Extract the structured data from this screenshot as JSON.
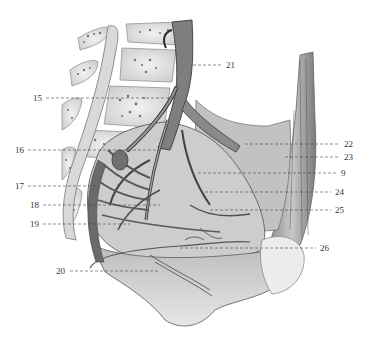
{
  "figure": {
    "colors": {
      "background": "#ffffff",
      "ink": "#2e2e2e",
      "tissue_light": "#d8d8d8",
      "tissue_mid": "#a8a8a8",
      "tissue_dark": "#5a5a5a",
      "leader": "#444444"
    }
  },
  "labels": [
    {
      "id": "21",
      "text": "21",
      "x": 226,
      "y": 61,
      "line": [
        193,
        65,
        222,
        65
      ]
    },
    {
      "id": "15",
      "text": "15",
      "x": 33,
      "y": 94,
      "line": [
        46,
        98,
        176,
        98
      ]
    },
    {
      "id": "16",
      "text": "16",
      "x": 15,
      "y": 146,
      "line": [
        28,
        150,
        162,
        150
      ]
    },
    {
      "id": "17",
      "text": "17",
      "x": 15,
      "y": 182,
      "line": [
        28,
        186,
        96,
        186
      ]
    },
    {
      "id": "18",
      "text": "18",
      "x": 30,
      "y": 201,
      "line": [
        43,
        205,
        160,
        205
      ]
    },
    {
      "id": "19",
      "text": "19",
      "x": 30,
      "y": 220,
      "line": [
        43,
        224,
        130,
        224
      ]
    },
    {
      "id": "20",
      "text": "20",
      "x": 56,
      "y": 267,
      "line": [
        70,
        271,
        160,
        271
      ]
    },
    {
      "id": "22",
      "text": "22",
      "x": 344,
      "y": 140,
      "line": [
        245,
        144,
        340,
        144
      ]
    },
    {
      "id": "23",
      "text": "23",
      "x": 344,
      "y": 153,
      "line": [
        285,
        157,
        340,
        157
      ]
    },
    {
      "id": "9",
      "text": "9",
      "x": 341,
      "y": 169,
      "line": [
        198,
        173,
        337,
        173
      ]
    },
    {
      "id": "24",
      "text": "24",
      "x": 335,
      "y": 188,
      "line": [
        205,
        192,
        331,
        192
      ]
    },
    {
      "id": "25",
      "text": "25",
      "x": 335,
      "y": 206,
      "line": [
        210,
        210,
        331,
        210
      ]
    },
    {
      "id": "26",
      "text": "26",
      "x": 320,
      "y": 244,
      "line": [
        180,
        248,
        316,
        248
      ]
    }
  ]
}
